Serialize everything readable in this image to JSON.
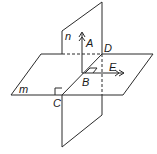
{
  "diagram": {
    "planes": [
      {
        "name": "m",
        "label": "m",
        "orientation": "horizontal"
      },
      {
        "name": "n",
        "label": "n",
        "orientation": "vertical"
      }
    ],
    "points": [
      {
        "name": "A",
        "label": "A"
      },
      {
        "name": "B",
        "label": "B"
      },
      {
        "name": "C",
        "label": "C"
      },
      {
        "name": "D",
        "label": "D"
      },
      {
        "name": "E",
        "label": "E"
      }
    ],
    "rays": [
      {
        "from": "B",
        "to": "A"
      },
      {
        "from": "B",
        "to": "E"
      }
    ],
    "right_angles": [
      "C",
      "B"
    ],
    "colors": {
      "line": "#2a2a2a",
      "text": "#1a1a1a",
      "background": "#ffffff"
    }
  }
}
